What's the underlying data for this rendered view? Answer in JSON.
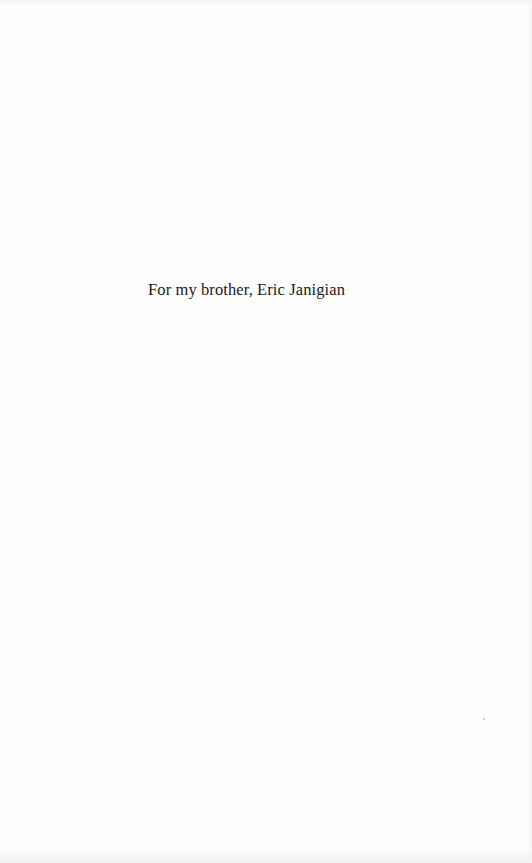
{
  "page": {
    "type": "dedication",
    "text": "For my brother, Eric Janigian",
    "background_color": "#fefefe",
    "text_color": "#1a1a1a"
  }
}
